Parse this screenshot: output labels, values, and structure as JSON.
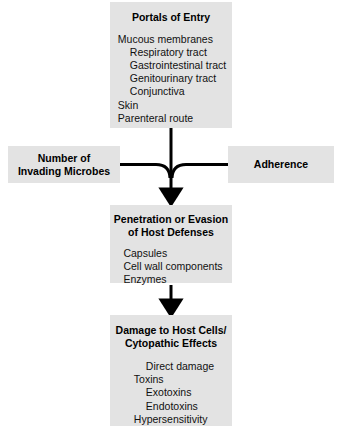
{
  "diagram": {
    "background_color": "#ffffff",
    "box_fill_color": "#e3e3e3",
    "line_color": "#000000",
    "boxes": {
      "portals": {
        "title": "Portals of Entry",
        "items": [
          {
            "text": "Mucous membranes",
            "indent": 0
          },
          {
            "text": "Respiratory tract",
            "indent": 1
          },
          {
            "text": "Gastrointestinal tract",
            "indent": 1
          },
          {
            "text": "Genitourinary tract",
            "indent": 1
          },
          {
            "text": "Conjunctiva",
            "indent": 1
          },
          {
            "text": "Skin",
            "indent": 0
          },
          {
            "text": "Parenteral route",
            "indent": 0
          }
        ]
      },
      "number_of_invading_microbes": {
        "title": "Number of\nInvading Microbes",
        "items": []
      },
      "adherence": {
        "title": "Adherence",
        "items": []
      },
      "penetration": {
        "title": "Penetration or Evasion\nof Host Defenses",
        "items": [
          {
            "text": "Capsules",
            "indent": 0
          },
          {
            "text": "Cell wall components",
            "indent": 0
          },
          {
            "text": "Enzymes",
            "indent": 0
          }
        ]
      },
      "damage": {
        "title": "Damage to Host Cells/\nCytopathic Effects",
        "items": [
          {
            "text": "Direct damage",
            "indent": 1
          },
          {
            "text": "Toxins",
            "indent": 0
          },
          {
            "text": "Exotoxins",
            "indent": 1
          },
          {
            "text": "Endotoxins",
            "indent": 1
          },
          {
            "text": "Hypersensitivity",
            "indent": 0
          }
        ]
      }
    },
    "connectors": [
      {
        "name": "portals-to-junction",
        "type": "vertical-line"
      },
      {
        "name": "number-to-junction",
        "type": "horizontal-curve-merge"
      },
      {
        "name": "adherence-to-junction",
        "type": "horizontal-curve-merge"
      },
      {
        "name": "junction-to-penetration",
        "type": "arrow-down"
      },
      {
        "name": "penetration-to-damage",
        "type": "arrow-down"
      }
    ]
  }
}
